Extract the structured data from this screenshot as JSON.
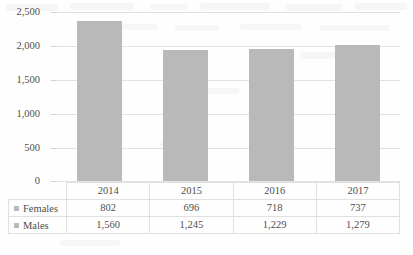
{
  "chart_data": {
    "type": "bar",
    "title": "",
    "subtitle": "",
    "xlabel": "",
    "ylabel": "",
    "categories": [
      "2014",
      "2015",
      "2016",
      "2017"
    ],
    "series": [
      {
        "name": "Females",
        "values": [
          802,
          696,
          718,
          737
        ]
      },
      {
        "name": "Males",
        "values": [
          1560,
          1245,
          1229,
          1279
        ]
      }
    ],
    "plotted_series": {
      "name": "Total",
      "note": "Stacked/total column shown as a single grey bar",
      "values": [
        2362,
        1941,
        1947,
        2016
      ]
    },
    "ylim": [
      0,
      2500
    ],
    "ytick_labels": [
      "0",
      "500",
      "1,000",
      "1,500",
      "2,000",
      "2,500"
    ],
    "ytick_values": [
      0,
      500,
      1000,
      1500,
      2000,
      2500
    ],
    "grid": true,
    "legend_position": "data-table-row-headers",
    "bar_color": "#b9b9b9",
    "gridline_color": "#e2e2e2"
  },
  "axis": {
    "ticks": [
      {
        "label": "2,500",
        "value": 2500
      },
      {
        "label": "2,000",
        "value": 2000
      },
      {
        "label": "1,500",
        "value": 1500
      },
      {
        "label": "1,000",
        "value": 1000
      },
      {
        "label": "500",
        "value": 500
      },
      {
        "label": "0",
        "value": 0
      }
    ]
  },
  "table": {
    "year_header": [
      "2014",
      "2015",
      "2016",
      "2017"
    ],
    "rows": [
      {
        "label": "Females",
        "values": [
          "802",
          "696",
          "718",
          "737"
        ]
      },
      {
        "label": "Males",
        "values": [
          "1,560",
          "1,245",
          "1,229",
          "1,279"
        ]
      }
    ]
  }
}
